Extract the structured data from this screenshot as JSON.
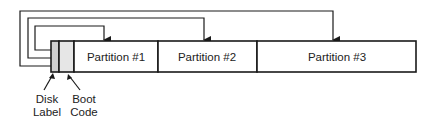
{
  "diagram": {
    "type": "disk-partition-layout",
    "segments": [
      {
        "id": "disk-label",
        "label": "",
        "x": 51,
        "w": 8,
        "fill": "#cfcfcf"
      },
      {
        "id": "boot-code",
        "label": "",
        "x": 59,
        "w": 15,
        "fill": "#e6e6e6"
      },
      {
        "id": "partition-1",
        "label": "Partition #1",
        "x": 74,
        "w": 84,
        "fill": "#ffffff"
      },
      {
        "id": "partition-2",
        "label": "Partition #2",
        "x": 158,
        "w": 99,
        "fill": "#ffffff"
      },
      {
        "id": "partition-3",
        "label": "Partition #3",
        "x": 257,
        "w": 159,
        "fill": "#ffffff"
      }
    ],
    "captions": {
      "disk_label_line1": "Disk",
      "disk_label_line2": "Label",
      "boot_code_line1": "Boot",
      "boot_code_line2": "Code"
    },
    "pointers": [
      {
        "from": "disk-label",
        "to": "partition-1",
        "level_y": 26,
        "left_x": 35,
        "target_x": 104
      },
      {
        "from": "disk-label",
        "to": "partition-2",
        "level_y": 18,
        "left_x": 28,
        "target_x": 204
      },
      {
        "from": "disk-label",
        "to": "partition-3",
        "level_y": 11,
        "left_x": 20,
        "target_x": 333
      }
    ],
    "colors": {
      "stroke": "#1a1a1a",
      "disk_label_fill": "#cfcfcf",
      "boot_code_fill": "#e6e6e6"
    }
  }
}
